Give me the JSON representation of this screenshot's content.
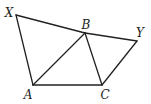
{
  "figure": {
    "points": {
      "X": {
        "label": "X",
        "x": 16,
        "y": 15,
        "lx": 9,
        "ly": 17
      },
      "B": {
        "label": "B",
        "x": 85,
        "y": 33,
        "lx": 86,
        "ly": 29
      },
      "Y": {
        "label": "Y",
        "x": 137,
        "y": 41,
        "lx": 140,
        "ly": 37
      },
      "A": {
        "label": "A",
        "x": 33,
        "y": 85,
        "lx": 28,
        "ly": 99
      },
      "C": {
        "label": "C",
        "x": 102,
        "y": 85,
        "lx": 105,
        "ly": 99
      }
    },
    "segments": [
      [
        "X",
        "B"
      ],
      [
        "B",
        "Y"
      ],
      [
        "X",
        "A"
      ],
      [
        "A",
        "B"
      ],
      [
        "B",
        "C"
      ],
      [
        "A",
        "C"
      ],
      [
        "C",
        "Y"
      ]
    ]
  }
}
